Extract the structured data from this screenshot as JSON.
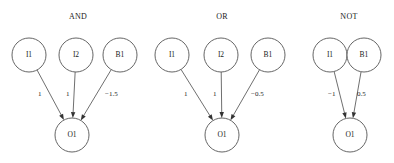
{
  "figure": {
    "background_color": "#ffffff",
    "stroke_color": "#555555",
    "text_color": "#1a1a1a",
    "width": 394,
    "height": 163
  },
  "groups": [
    {
      "id": "and",
      "title": "AND",
      "title_x": 78,
      "title_y": 17,
      "input_nodes": [
        {
          "label": "I1",
          "cx": 29,
          "cy": 55,
          "r": 17
        },
        {
          "label": "I2",
          "cx": 76,
          "cy": 55,
          "r": 17
        },
        {
          "label": "B1",
          "cx": 120,
          "cy": 55,
          "r": 17
        }
      ],
      "output_node": {
        "label": "O1",
        "cx": 72,
        "cy": 135,
        "r": 17
      },
      "edges": [
        {
          "from": "I1",
          "to": "O1",
          "weight": "1",
          "label_x": 38,
          "label_y": 94
        },
        {
          "from": "I2",
          "to": "O1",
          "weight": "1",
          "label_x": 66,
          "label_y": 94
        },
        {
          "from": "B1",
          "to": "O1",
          "weight": "−1.5",
          "label_x": 105,
          "label_y": 94
        }
      ]
    },
    {
      "id": "or",
      "title": "OR",
      "title_x": 222,
      "title_y": 17,
      "input_nodes": [
        {
          "label": "I1",
          "cx": 172,
          "cy": 55,
          "r": 17
        },
        {
          "label": "I2",
          "cx": 221,
          "cy": 55,
          "r": 17
        },
        {
          "label": "B1",
          "cx": 268,
          "cy": 55,
          "r": 17
        }
      ],
      "output_node": {
        "label": "O1",
        "cx": 222,
        "cy": 135,
        "r": 17
      },
      "edges": [
        {
          "from": "I1",
          "to": "O1",
          "weight": "1",
          "label_x": 184,
          "label_y": 94
        },
        {
          "from": "I2",
          "to": "O1",
          "weight": "1",
          "label_x": 213,
          "label_y": 94
        },
        {
          "from": "B1",
          "to": "O1",
          "weight": "−0.5",
          "label_x": 251,
          "label_y": 94
        }
      ]
    },
    {
      "id": "not",
      "title": "NOT",
      "title_x": 349,
      "title_y": 17,
      "input_nodes": [
        {
          "label": "I1",
          "cx": 330,
          "cy": 55,
          "r": 17
        },
        {
          "label": "B1",
          "cx": 364,
          "cy": 55,
          "r": 17
        }
      ],
      "output_node": {
        "label": "O1",
        "cx": 350,
        "cy": 135,
        "r": 17
      },
      "edges": [
        {
          "from": "I1",
          "to": "O1",
          "weight": "−1",
          "label_x": 328,
          "label_y": 94
        },
        {
          "from": "B1",
          "to": "O1",
          "weight": "0.5",
          "label_x": 357,
          "label_y": 94
        }
      ]
    }
  ]
}
